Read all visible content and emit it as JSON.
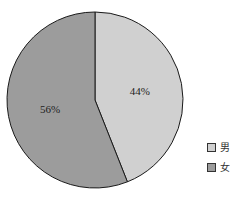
{
  "chart_data": {
    "type": "pie",
    "title": "",
    "categories": [
      "男",
      "女"
    ],
    "values": [
      44,
      56
    ],
    "labels": [
      "44%",
      "56%"
    ],
    "colors": [
      "#d0d0d0",
      "#9c9c9c"
    ],
    "start_angle_deg": 0,
    "direction": "clockwise",
    "legend_position": "right-bottom"
  },
  "legend": {
    "items": [
      {
        "label": "男",
        "color": "#d0d0d0"
      },
      {
        "label": "女",
        "color": "#9c9c9c"
      }
    ]
  }
}
